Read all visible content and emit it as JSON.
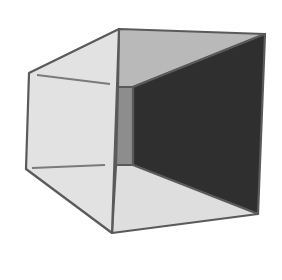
{
  "figure": {
    "width": 282,
    "height": 280,
    "background": "#ffffff",
    "edge_color": "#5a5a5a",
    "edge_width": 2.2,
    "faces": {
      "left_outer": {
        "points": "29,73 119,29 112,233 26,169",
        "fill": "#e2e2e2"
      },
      "top_inner": {
        "points": "119,29 265,34 133,87 118,87",
        "fill": "#b9b9b9"
      },
      "right_inner": {
        "points": "265,34 258,214 133,165 133,87",
        "fill": "#2f2f2f"
      },
      "bottom_inner": {
        "points": "116,165 133,165 258,214 112,233",
        "fill": "#dedede"
      },
      "back_wall": {
        "points": "118,87 133,87 133,165 116,165",
        "fill": "#8d8d8d"
      }
    },
    "inner_lines": [
      {
        "x1": 37,
        "y1": 75,
        "x2": 110,
        "y2": 84,
        "stroke": "#7a7a7a"
      },
      {
        "x1": 32,
        "y1": 168,
        "x2": 105,
        "y2": 165,
        "stroke": "#7a7a7a"
      }
    ]
  }
}
